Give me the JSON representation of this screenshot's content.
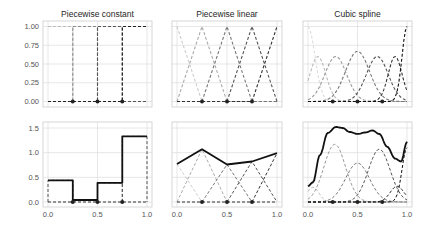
{
  "chart_data": [
    {
      "type": "line",
      "panel": "top-left",
      "title": "Piecewise constant",
      "xlabel": "",
      "ylabel": "",
      "xlim": [
        0,
        1
      ],
      "ylim": [
        -0.05,
        1.05
      ],
      "yticks": [
        "0.00",
        "0.25",
        "0.50",
        "0.75",
        "1.00"
      ],
      "xticks": [],
      "grid": true,
      "knots": [
        0.25,
        0.5,
        0.75
      ],
      "basis": [
        {
          "name": "b0",
          "color": "#bbbbbb",
          "x": [
            0,
            0.25,
            0.25,
            1
          ],
          "y": [
            1,
            1,
            0,
            0
          ]
        },
        {
          "name": "b1",
          "color": "#888888",
          "x": [
            0,
            0.25,
            0.25,
            0.5,
            0.5,
            1
          ],
          "y": [
            0,
            0,
            1,
            1,
            0,
            0
          ]
        },
        {
          "name": "b2",
          "color": "#555555",
          "x": [
            0,
            0.5,
            0.5,
            0.75,
            0.75,
            1
          ],
          "y": [
            0,
            0,
            1,
            1,
            0,
            0
          ]
        },
        {
          "name": "b3",
          "color": "#222222",
          "x": [
            0,
            0.75,
            0.75,
            1
          ],
          "y": [
            0,
            0,
            1,
            1
          ]
        }
      ]
    },
    {
      "type": "line",
      "panel": "top-middle",
      "title": "Piecewise linear",
      "xlim": [
        0,
        1
      ],
      "ylim": [
        -0.05,
        1.05
      ],
      "grid": true,
      "knots": [
        0.25,
        0.5,
        0.75
      ],
      "basis": [
        {
          "name": "b0",
          "color": "#cccccc",
          "x": [
            0,
            0.25,
            1
          ],
          "y": [
            1,
            0,
            0
          ]
        },
        {
          "name": "b1",
          "color": "#aaaaaa",
          "x": [
            0,
            0.25,
            0.5,
            1
          ],
          "y": [
            0,
            1,
            0,
            0
          ]
        },
        {
          "name": "b2",
          "color": "#777777",
          "x": [
            0,
            0.25,
            0.5,
            0.75,
            1
          ],
          "y": [
            0,
            0,
            1,
            0,
            0
          ]
        },
        {
          "name": "b3",
          "color": "#555555",
          "x": [
            0,
            0.5,
            0.75,
            1
          ],
          "y": [
            0,
            0,
            1,
            0
          ]
        },
        {
          "name": "b4",
          "color": "#333333",
          "x": [
            0,
            0.75,
            1
          ],
          "y": [
            0,
            0,
            1
          ]
        }
      ]
    },
    {
      "type": "line",
      "panel": "top-right",
      "title": "Cubic spline",
      "xlim": [
        0,
        1
      ],
      "ylim": [
        -0.05,
        1.05
      ],
      "grid": true,
      "knots": [
        0.25,
        0.5,
        0.75
      ],
      "basis_peaks": [
        {
          "name": "b0",
          "color": "#dddddd",
          "peak_x": 0.0,
          "peak_y": 1.0,
          "width": 0.07
        },
        {
          "name": "b1",
          "color": "#bbbbbb",
          "peak_x": 0.1,
          "peak_y": 0.6,
          "width": 0.08
        },
        {
          "name": "b2",
          "color": "#999999",
          "peak_x": 0.28,
          "peak_y": 0.6,
          "width": 0.11
        },
        {
          "name": "b3",
          "color": "#777777",
          "peak_x": 0.5,
          "peak_y": 0.67,
          "width": 0.12
        },
        {
          "name": "b4",
          "color": "#555555",
          "peak_x": 0.7,
          "peak_y": 0.6,
          "width": 0.11
        },
        {
          "name": "b5",
          "color": "#333333",
          "peak_x": 0.88,
          "peak_y": 0.6,
          "width": 0.07
        },
        {
          "name": "b6",
          "color": "#111111",
          "peak_x": 1.0,
          "peak_y": 1.0,
          "width": 0.05
        }
      ]
    },
    {
      "type": "line",
      "panel": "bottom-left",
      "title": "",
      "xlim": [
        0,
        1
      ],
      "ylim": [
        -0.08,
        1.6
      ],
      "yticks": [
        "0.0",
        "0.5",
        "1.0",
        "1.5"
      ],
      "xticks": [
        "0.0",
        "0.5",
        "1.0"
      ],
      "grid": true,
      "knots": [
        0.25,
        0.5,
        0.75
      ],
      "fit": {
        "x": [
          0,
          0.25,
          0.25,
          0.5,
          0.5,
          0.75,
          0.75,
          1
        ],
        "y": [
          0.44,
          0.44,
          0.04,
          0.04,
          0.39,
          0.39,
          1.33,
          1.33
        ]
      },
      "weighted_basis_heights": [
        0.44,
        0.04,
        0.39,
        1.33
      ]
    },
    {
      "type": "line",
      "panel": "bottom-middle",
      "title": "",
      "xlim": [
        0,
        1
      ],
      "ylim": [
        -0.08,
        1.6
      ],
      "xticks": [
        "0.0",
        "0.5",
        "1.0"
      ],
      "grid": true,
      "knots": [
        0.25,
        0.5,
        0.75
      ],
      "fit": {
        "x": [
          0,
          0.25,
          0.5,
          0.75,
          1
        ],
        "y": [
          0.77,
          1.07,
          0.76,
          0.82,
          0.99
        ]
      }
    },
    {
      "type": "line",
      "panel": "bottom-right",
      "title": "",
      "xlim": [
        0,
        1
      ],
      "ylim": [
        -0.08,
        1.6
      ],
      "xticks": [
        "0.0",
        "0.5",
        "1.0"
      ],
      "grid": true,
      "knots": [
        0.25,
        0.5,
        0.75
      ],
      "fit": {
        "x": [
          0,
          0.05,
          0.12,
          0.2,
          0.28,
          0.35,
          0.42,
          0.5,
          0.58,
          0.65,
          0.72,
          0.8,
          0.88,
          0.94,
          1.0
        ],
        "y": [
          0.32,
          0.4,
          0.95,
          1.4,
          1.52,
          1.5,
          1.42,
          1.38,
          1.41,
          1.45,
          1.38,
          1.12,
          0.88,
          0.82,
          1.22
        ]
      },
      "weighted_basis_peaks": [
        {
          "color": "#bbbbbb",
          "peak_x": 0.05,
          "peak_y": 0.3,
          "width": 0.06
        },
        {
          "color": "#999999",
          "peak_x": 0.27,
          "peak_y": 1.17,
          "width": 0.11
        },
        {
          "color": "#777777",
          "peak_x": 0.5,
          "peak_y": 0.79,
          "width": 0.12
        },
        {
          "color": "#555555",
          "peak_x": 0.72,
          "peak_y": 1.07,
          "width": 0.11
        },
        {
          "color": "#333333",
          "peak_x": 0.9,
          "peak_y": 0.32,
          "width": 0.07
        },
        {
          "color": "#111111",
          "peak_x": 1.0,
          "peak_y": 1.1,
          "width": 0.05
        }
      ]
    }
  ],
  "figure": {
    "titles": [
      "Piecewise constant",
      "Piecewise linear",
      "Cubic spline"
    ],
    "x_ticks": [
      "0.0",
      "0.5",
      "1.0"
    ],
    "top_y_ticks": [
      "0.00",
      "0.25",
      "0.50",
      "0.75",
      "1.00"
    ],
    "bottom_y_ticks": [
      "0.0",
      "0.5",
      "1.0",
      "1.5"
    ]
  }
}
